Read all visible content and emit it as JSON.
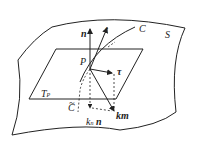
{
  "diagram": {
    "labels": {
      "n": "n",
      "t": "t",
      "C": "C",
      "S": "S",
      "P": "P",
      "tau": "τ",
      "T": "T",
      "T_sub": "P",
      "C_tilde": "C",
      "C_tilde_mark": "~",
      "km": "km",
      "k": "k",
      "k_sub": "n",
      "kn_n": "n"
    },
    "colors": {
      "line": "#222222",
      "background": "#ffffff"
    }
  }
}
